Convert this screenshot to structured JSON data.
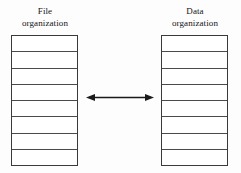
{
  "diagram": {
    "type": "relationship-diagram",
    "background_color": "#fdfdfd",
    "line_color": "#3a3a3a",
    "text_color": "#141414",
    "left_column": {
      "label_line_1": "File",
      "label_line_2": "organization",
      "row_count": 8,
      "rows": [
        "",
        "",
        "",
        "",
        "",
        "",
        "",
        ""
      ]
    },
    "right_column": {
      "label_line_1": "Data",
      "label_line_2": "organization",
      "row_count": 8,
      "rows": [
        "",
        "",
        "",
        "",
        "",
        "",
        "",
        ""
      ]
    },
    "connector": {
      "icon": "double-headed-arrow",
      "direction": "bidirectional",
      "label": "",
      "color": "#1a1a1a"
    }
  }
}
